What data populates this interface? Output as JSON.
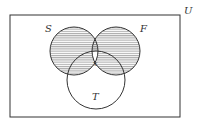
{
  "diagram": {
    "type": "venn",
    "universe_label": "U",
    "sets": [
      {
        "label": "S",
        "cx": 74,
        "cy": 51,
        "r": 24,
        "label_x": 45,
        "label_y": 32
      },
      {
        "label": "F",
        "cx": 116,
        "cy": 51,
        "r": 24,
        "label_x": 140,
        "label_y": 32
      },
      {
        "label": "T",
        "cx": 96,
        "cy": 80,
        "r": 29,
        "label_x": 93,
        "label_y": 99
      }
    ],
    "center_label": "x",
    "shaded_region": "(S ∪ F) minus (S ∩ F ∩ T)",
    "shading_style": "horizontal-lines",
    "colors": {
      "stroke": "#333333",
      "hatch": "#666666",
      "background": "#ffffff"
    }
  }
}
